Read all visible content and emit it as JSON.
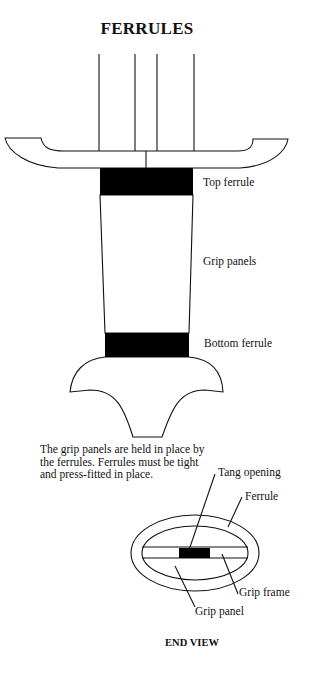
{
  "title": "FERRULES",
  "side_view": {
    "labels": {
      "top_ferrule": "Top ferrule",
      "grip_panels": "Grip panels",
      "bottom_ferrule": "Bottom ferrule"
    }
  },
  "note": "The grip panels are held in place by the ferrules. Ferrules must be tight and press-fitted in place.",
  "end_view": {
    "caption": "END VIEW",
    "labels": {
      "tang_opening": "Tang opening",
      "ferrule": "Ferrule",
      "grip_frame": "Grip frame",
      "grip_panel": "Grip panel"
    }
  },
  "colors": {
    "ink": "#111111",
    "fill": "#000000",
    "background": "#ffffff"
  }
}
